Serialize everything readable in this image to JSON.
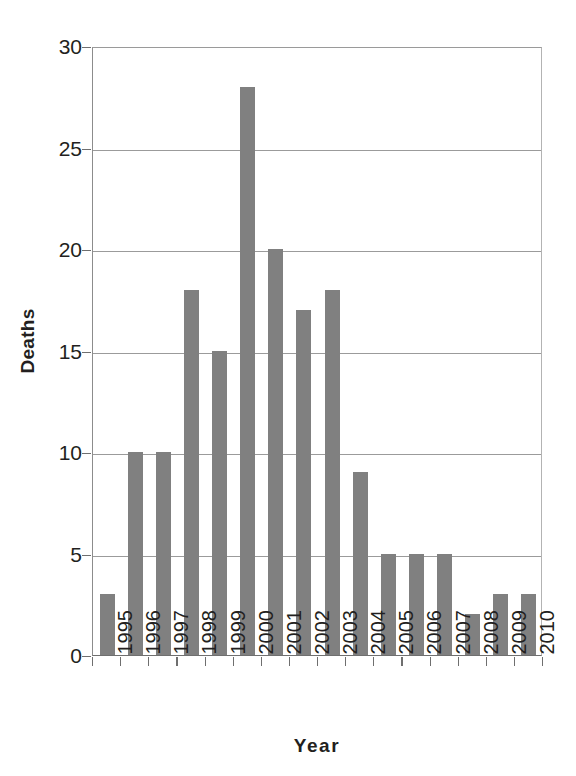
{
  "chart_data": {
    "type": "bar",
    "title": "",
    "xlabel": "Year",
    "ylabel": "Deaths",
    "categories": [
      "1995",
      "1996",
      "1997",
      "1998",
      "1999",
      "2000",
      "2001",
      "2002",
      "2003",
      "2004",
      "2005",
      "2006",
      "2007",
      "2008",
      "2009",
      "2010"
    ],
    "values": [
      3,
      10,
      10,
      18,
      15,
      28,
      20,
      17,
      18,
      9,
      5,
      5,
      5,
      2,
      3,
      3
    ],
    "ylim": [
      0,
      30
    ],
    "yticks": [
      0,
      5,
      10,
      15,
      20,
      25,
      30
    ],
    "ytick_labels": [
      "0",
      "5",
      "10",
      "15",
      "20",
      "25",
      "30"
    ],
    "grid": "horizontal",
    "legend": "none",
    "bar_color": "#808080",
    "background_color": "#ffffff",
    "axis_color": "#6f6f6f",
    "gridline_color": "#9b9b9b",
    "text_color": "#231f20"
  }
}
